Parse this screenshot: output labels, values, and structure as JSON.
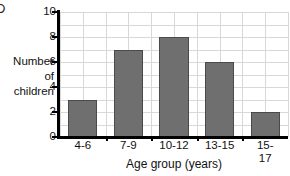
{
  "corner_mark": "D",
  "chart_data": {
    "type": "bar",
    "title": "",
    "categories": [
      "4-6",
      "7-9",
      "10-12",
      "13-15",
      "15-17"
    ],
    "values": [
      3,
      7,
      8,
      6,
      2
    ],
    "xlabel": "Age group (years)",
    "ylabel_lines": [
      "Number",
      "of",
      "children"
    ],
    "ylabel": "Number of children",
    "ylim": [
      0,
      10
    ],
    "ytick_labels": [
      "0",
      "2",
      "4",
      "6",
      "8",
      "10"
    ],
    "ytick_values": [
      0,
      2,
      4,
      6,
      8,
      10
    ],
    "ytick_step": 2,
    "minor_grid_step": 1,
    "grid": true,
    "legend": "none",
    "bar_color": "#6f6f6f",
    "bar_edge_color": "#4a4a4a",
    "grid_color": "#d8d8d8",
    "axis_color": "#000000"
  }
}
